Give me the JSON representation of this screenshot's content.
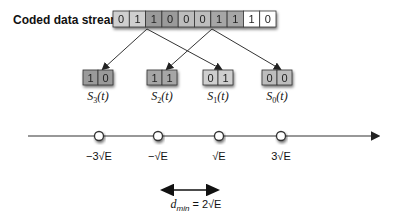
{
  "stream": {
    "label": "Coded data stream",
    "bits": [
      "0",
      "1",
      "1",
      "0",
      "0",
      "0",
      "1",
      "1",
      "1",
      "0"
    ],
    "shades": [
      "#cfcfcf",
      "#cfcfcf",
      "#9a9a9a",
      "#9a9a9a",
      "#bdbdbd",
      "#bdbdbd",
      "#a6a6a6",
      "#a6a6a6",
      "#ffffff",
      "#ffffff"
    ]
  },
  "states": [
    {
      "bits": [
        "1",
        "0"
      ],
      "name": "S",
      "sub": "3",
      "arg": "(t)",
      "shade": "#9a9a9a"
    },
    {
      "bits": [
        "1",
        "1"
      ],
      "name": "S",
      "sub": "2",
      "arg": "(t)",
      "shade": "#a6a6a6"
    },
    {
      "bits": [
        "0",
        "1"
      ],
      "name": "S",
      "sub": "1",
      "arg": "(t)",
      "shade": "#cfcfcf"
    },
    {
      "bits": [
        "0",
        "0"
      ],
      "name": "S",
      "sub": "0",
      "arg": "(t)",
      "shade": "#bdbdbd"
    }
  ],
  "constellation": {
    "points": [
      "−3√E",
      "−√E",
      "√E",
      "3√E"
    ]
  },
  "distance": {
    "label": "d_min = 2√E",
    "d": "d",
    "sub": "min",
    "rhs": " = 2√E"
  }
}
